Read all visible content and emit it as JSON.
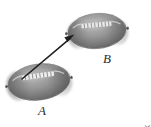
{
  "figure": {
    "background_color": "#ffffff",
    "width": 151,
    "height": 127
  },
  "labels": {
    "football_a": "A",
    "football_b": "B",
    "label_color": "#2b2b2b"
  },
  "credit": {
    "text": "RTimages/Shutterstock",
    "color": "#7d7d7d",
    "orientation": "vertical"
  },
  "objects": {
    "football_a": {
      "name": "A",
      "center_x": 39,
      "center_y": 82,
      "width": 62,
      "height": 36,
      "rotation_deg": -8,
      "fill_color": "#8d8d8d",
      "edge_color": "#4a4a4a",
      "lace_color": "#efefef",
      "lace_count": 8
    },
    "football_b": {
      "name": "B",
      "center_x": 97,
      "center_y": 31,
      "width": 58,
      "height": 35,
      "rotation_deg": -5,
      "fill_color": "#8d8d8d",
      "edge_color": "#4a4a4a",
      "lace_color": "#efefef",
      "lace_count": 8
    }
  },
  "arrow": {
    "name": "displacement-arrow",
    "from_x": 22,
    "from_y": 79,
    "to_x": 74,
    "to_y": 35,
    "color": "#1e1e1e",
    "stroke_width": 1.6,
    "head_length": 9,
    "head_width": 6
  }
}
